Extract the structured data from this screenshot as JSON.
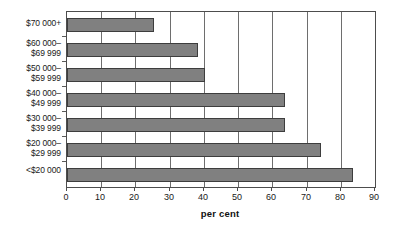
{
  "chart_data": {
    "type": "bar",
    "orientation": "horizontal",
    "title": "",
    "xlabel": "per cent",
    "ylabel": "",
    "categories": [
      "$70 000+",
      "$60 000–\n$69 999",
      "$50 000–\n$59 999",
      "$40 000–\n$49 999",
      "$30 000–\n$39 999",
      "$20 000–\n$29 999",
      "<$20 000"
    ],
    "values": [
      25.4,
      38.3,
      40.2,
      63.7,
      63.7,
      74.3,
      83.6
    ],
    "xlim": [
      0,
      90
    ],
    "xticks": [
      0,
      10,
      20,
      30,
      40,
      50,
      60,
      70,
      80,
      90
    ],
    "xtick_labels": [
      "0",
      "10",
      "20",
      "30",
      "40",
      "50",
      "60",
      "70",
      "80",
      "90"
    ],
    "grid": "vertical",
    "legend": "none",
    "bar_color": "#808080",
    "bar_border_color": "#3d3d3d",
    "axis_color": "#4d4d4d",
    "gridline_color": "#6e6e6e",
    "background_color": "#ffffff"
  }
}
